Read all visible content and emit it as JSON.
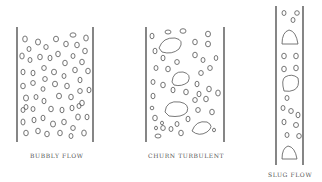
{
  "figure": {
    "panels": [
      {
        "id": "bubbly",
        "label": "BUBBLY FLOW"
      },
      {
        "id": "churn",
        "label": "CHURN TURBULENT"
      },
      {
        "id": "slug",
        "label": "SLUG FLOW"
      }
    ]
  }
}
